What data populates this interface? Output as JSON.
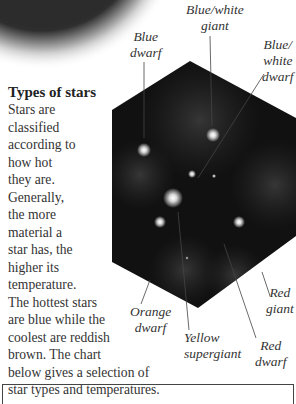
{
  "heading": "Types of stars",
  "body_lines": [
    "Stars are",
    "classified",
    "according to",
    "how hot",
    "they are.",
    "Generally,",
    "the more",
    "material a",
    "star has, the",
    "higher its",
    "temperature.",
    "The hottest stars",
    "are blue while the",
    "coolest are reddish",
    "brown. The chart",
    "below gives a selection of",
    "star types and temperatures."
  ],
  "labels": {
    "blue_white_giant": [
      "Blue/white",
      "giant"
    ],
    "blue_dwarf": [
      "Blue",
      "dwarf"
    ],
    "blue_white_dwarf": [
      "Blue/",
      "white",
      "dwarf"
    ],
    "orange_dwarf": [
      "Orange",
      "dwarf"
    ],
    "yellow_supergiant": [
      "Yellow",
      "supergiant"
    ],
    "red_giant": [
      "Red",
      "giant"
    ],
    "red_dwarf": [
      "Red",
      "dwarf"
    ]
  },
  "colors": {
    "hexagon_fill": "#111111",
    "text": "#333333",
    "leader_line": "#444444"
  }
}
